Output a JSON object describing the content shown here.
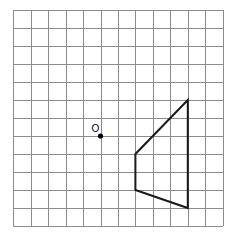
{
  "grid": {
    "columns": 12,
    "rows": 12,
    "origin_px": [
      13.3,
      10
    ],
    "cell_width_px": 17.45,
    "cell_height_px": 18,
    "line_color": "#8c8c8c"
  },
  "point": {
    "label": "O",
    "grid_position": [
      5,
      7
    ],
    "color": "#000000"
  },
  "shape": {
    "type": "quadrilateral",
    "stroke_color": "#1a1a1a",
    "vertices_grid": [
      [
        10,
        5
      ],
      [
        7,
        8
      ],
      [
        7,
        10
      ],
      [
        10,
        11
      ]
    ]
  }
}
